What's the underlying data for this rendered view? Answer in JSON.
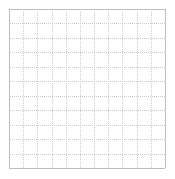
{
  "canvas": {
    "width": 175,
    "height": 179,
    "background_color": "#ffffff"
  },
  "chart_data": {
    "type": "table",
    "title": "",
    "subtitle": "",
    "xlabel": "",
    "ylabel": "",
    "categories": [],
    "values": [],
    "series": [],
    "annotations": [],
    "legend": {
      "visible": false,
      "position": "none",
      "entries": []
    },
    "grid": {
      "visible": true,
      "origin_x": 9,
      "origin_y": 9,
      "width": 156,
      "height": 159,
      "columns": 11,
      "rows": 11,
      "cell_width": 14.18,
      "cell_height": 14.45,
      "line_color": "#c9c9c9",
      "border_color": "#bdbdbd",
      "line_width": 1,
      "line_style": "dotted"
    },
    "axes": {
      "x_range": [
        0,
        11
      ],
      "y_range": [
        0,
        11
      ],
      "x_ticks": [],
      "y_ticks": [],
      "x_tick_labels": [],
      "y_tick_labels": [],
      "visible": false
    }
  }
}
